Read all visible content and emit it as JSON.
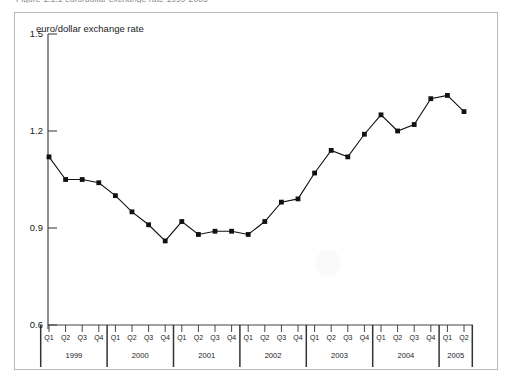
{
  "figure": {
    "caption": "Figure 1.1.1  euro/dollar exchange rate 1999-2005"
  },
  "chart_data": {
    "type": "line",
    "title": "",
    "ylabel": "euro/dollar exchange rate",
    "xlabel": "",
    "ylim": [
      0.6,
      1.5
    ],
    "yticks": [
      "0.6",
      "0.9",
      "1.2",
      "1.5"
    ],
    "ytick_values": [
      0.6,
      0.9,
      1.2,
      1.5
    ],
    "grid": false,
    "legend": "none",
    "marker": "square",
    "line_color": "#111111",
    "marker_color": "#111111",
    "categories": [
      "Q1 1999",
      "Q2 1999",
      "Q3 1999",
      "Q4 1999",
      "Q1 2000",
      "Q2 2000",
      "Q3 2000",
      "Q4 2000",
      "Q1 2001",
      "Q2 2001",
      "Q3 2001",
      "Q4 2001",
      "Q1 2002",
      "Q2 2002",
      "Q3 2002",
      "Q4 2002",
      "Q1 2003",
      "Q2 2003",
      "Q3 2003",
      "Q4 2003",
      "Q1 2004",
      "Q2 2004",
      "Q3 2004",
      "Q4 2004",
      "Q1 2005",
      "Q2 2005"
    ],
    "quarter_labels": [
      "Q1",
      "Q2",
      "Q3",
      "Q4",
      "Q1",
      "Q2",
      "Q3",
      "Q4",
      "Q1",
      "Q2",
      "Q3",
      "Q4",
      "Q1",
      "Q2",
      "Q3",
      "Q4",
      "Q1",
      "Q2",
      "Q3",
      "Q4",
      "Q1",
      "Q2",
      "Q3",
      "Q4",
      "Q1",
      "Q2"
    ],
    "year_labels": [
      "1999",
      "2000",
      "2001",
      "2002",
      "2003",
      "2004",
      "2005"
    ],
    "year_spans": [
      4,
      4,
      4,
      4,
      4,
      4,
      2
    ],
    "values": [
      1.12,
      1.05,
      1.05,
      1.04,
      1.0,
      0.95,
      0.91,
      0.86,
      0.92,
      0.88,
      0.89,
      0.89,
      0.88,
      0.92,
      0.98,
      0.99,
      1.07,
      1.14,
      1.12,
      1.19,
      1.25,
      1.2,
      1.22,
      1.3,
      1.31,
      1.26
    ]
  }
}
